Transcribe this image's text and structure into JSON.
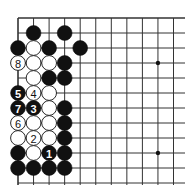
{
  "board": {
    "origin_x": 18,
    "origin_y": 18,
    "spacing_x": 15.55,
    "spacing_y": 15,
    "cols_visible": 12,
    "rows_visible": 12,
    "line_color": "#333333",
    "black_color": "#111111",
    "white_color": "#ffffff",
    "star_points": [
      [
        9,
        3
      ],
      [
        9,
        9
      ]
    ]
  },
  "stones": [
    {
      "c": 1,
      "r": 1,
      "color": "black",
      "label": ""
    },
    {
      "c": 3,
      "r": 1,
      "color": "black",
      "label": ""
    },
    {
      "c": 0,
      "r": 2,
      "color": "black",
      "label": ""
    },
    {
      "c": 1,
      "r": 2,
      "color": "white",
      "label": ""
    },
    {
      "c": 2,
      "r": 2,
      "color": "black",
      "label": ""
    },
    {
      "c": 4,
      "r": 2,
      "color": "black",
      "label": ""
    },
    {
      "c": 0,
      "r": 3,
      "color": "white",
      "label": "8"
    },
    {
      "c": 1,
      "r": 3,
      "color": "white",
      "label": ""
    },
    {
      "c": 2,
      "r": 3,
      "color": "white",
      "label": ""
    },
    {
      "c": 3,
      "r": 3,
      "color": "black",
      "label": ""
    },
    {
      "c": 1,
      "r": 4,
      "color": "white",
      "label": ""
    },
    {
      "c": 2,
      "r": 4,
      "color": "black",
      "label": ""
    },
    {
      "c": 3,
      "r": 4,
      "color": "black",
      "label": ""
    },
    {
      "c": 0,
      "r": 5,
      "color": "black",
      "label": "5"
    },
    {
      "c": 1,
      "r": 5,
      "color": "white",
      "label": "4"
    },
    {
      "c": 2,
      "r": 5,
      "color": "white",
      "label": ""
    },
    {
      "c": 0,
      "r": 6,
      "color": "black",
      "label": "7"
    },
    {
      "c": 1,
      "r": 6,
      "color": "black",
      "label": "3"
    },
    {
      "c": 2,
      "r": 6,
      "color": "white",
      "label": ""
    },
    {
      "c": 3,
      "r": 6,
      "color": "black",
      "label": ""
    },
    {
      "c": 0,
      "r": 7,
      "color": "white",
      "label": "6"
    },
    {
      "c": 1,
      "r": 7,
      "color": "white",
      "label": ""
    },
    {
      "c": 2,
      "r": 7,
      "color": "white",
      "label": ""
    },
    {
      "c": 3,
      "r": 7,
      "color": "black",
      "label": ""
    },
    {
      "c": 0,
      "r": 8,
      "color": "white",
      "label": ""
    },
    {
      "c": 1,
      "r": 8,
      "color": "white",
      "label": "2"
    },
    {
      "c": 2,
      "r": 8,
      "color": "white",
      "label": ""
    },
    {
      "c": 3,
      "r": 8,
      "color": "black",
      "label": ""
    },
    {
      "c": 0,
      "r": 9,
      "color": "black",
      "label": ""
    },
    {
      "c": 1,
      "r": 9,
      "color": "white",
      "label": ""
    },
    {
      "c": 2,
      "r": 9,
      "color": "black",
      "label": "1"
    },
    {
      "c": 3,
      "r": 9,
      "color": "black",
      "label": ""
    },
    {
      "c": 0,
      "r": 10,
      "color": "black",
      "label": ""
    },
    {
      "c": 1,
      "r": 10,
      "color": "black",
      "label": ""
    },
    {
      "c": 2,
      "r": 10,
      "color": "black",
      "label": ""
    },
    {
      "c": 3,
      "r": 10,
      "color": "black",
      "label": ""
    }
  ]
}
